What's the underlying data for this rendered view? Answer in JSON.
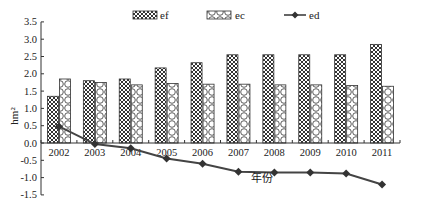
{
  "chart_data": {
    "type": "bar",
    "title": "",
    "xlabel": "年份",
    "ylabel": "hm²",
    "ylim": [
      -1.5,
      3.5
    ],
    "yticks": [
      3.5,
      3.0,
      2.5,
      2.0,
      1.5,
      1.0,
      0.5,
      0.0,
      -0.5,
      -1.0,
      -1.5
    ],
    "ytick_labels": [
      "3.5",
      "3.0",
      "2.5",
      "2.0",
      "1.5",
      "1.0",
      "0.5",
      "0.0",
      "-0.5",
      "-1.0",
      "-1.5"
    ],
    "grid": false,
    "legend_position": "top",
    "categories": [
      "2002",
      "2003",
      "2004",
      "2005",
      "2006",
      "2007",
      "2008",
      "2009",
      "2010",
      "2011"
    ],
    "series": [
      {
        "name": "ef",
        "type": "bar",
        "pattern": "crosshatch",
        "values": [
          1.35,
          1.8,
          1.85,
          2.17,
          2.32,
          2.55,
          2.55,
          2.55,
          2.55,
          2.85
        ]
      },
      {
        "name": "ec",
        "type": "bar",
        "pattern": "circles",
        "values": [
          1.85,
          1.75,
          1.68,
          1.72,
          1.7,
          1.7,
          1.68,
          1.68,
          1.66,
          1.64
        ]
      },
      {
        "name": "ed",
        "type": "line",
        "marker": "diamond",
        "values": [
          0.48,
          -0.03,
          -0.15,
          -0.45,
          -0.6,
          -0.83,
          -0.85,
          -0.85,
          -0.88,
          -1.2
        ]
      }
    ]
  },
  "legend": {
    "ef": "ef",
    "ec": "ec",
    "ed": "ed"
  },
  "axes": {
    "x_title": "年份",
    "y_title": "hm²"
  }
}
